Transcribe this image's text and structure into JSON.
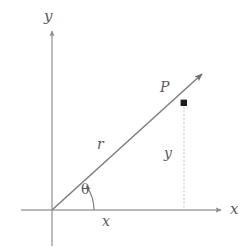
{
  "figure": {
    "kind": "polar-coordinates-diagram",
    "background_color": "#ffffff",
    "axis_color": "#9a9a9a",
    "ray_color": "#808080",
    "dotted_color": "#c8c8c8",
    "label_color": "#5a5a5a",
    "point_color": "#1a1a1a"
  },
  "axes": {
    "y_axis_label": "y",
    "x_axis_label": "x",
    "origin": {
      "x": 52,
      "y": 210
    }
  },
  "labels": {
    "point": "P",
    "radius": "r",
    "angle": "θ",
    "leg_vertical": "y",
    "leg_horizontal": "x"
  },
  "geometry": {
    "point_P": {
      "x": 184,
      "y": 103
    },
    "ray_angle_degrees": 35,
    "ray_tip": {
      "x": 205,
      "y": 71
    },
    "y_axis_top": {
      "x": 52,
      "y": 28
    },
    "y_axis_bottom": {
      "x": 52,
      "y": 246
    },
    "x_axis_left": {
      "x": 21,
      "y": 210
    },
    "x_axis_right": {
      "x": 224,
      "y": 210
    },
    "dotted_drop_from": {
      "x": 184,
      "y": 105
    },
    "dotted_drop_to": {
      "x": 184,
      "y": 209
    },
    "angle_arc_radius": 42
  }
}
